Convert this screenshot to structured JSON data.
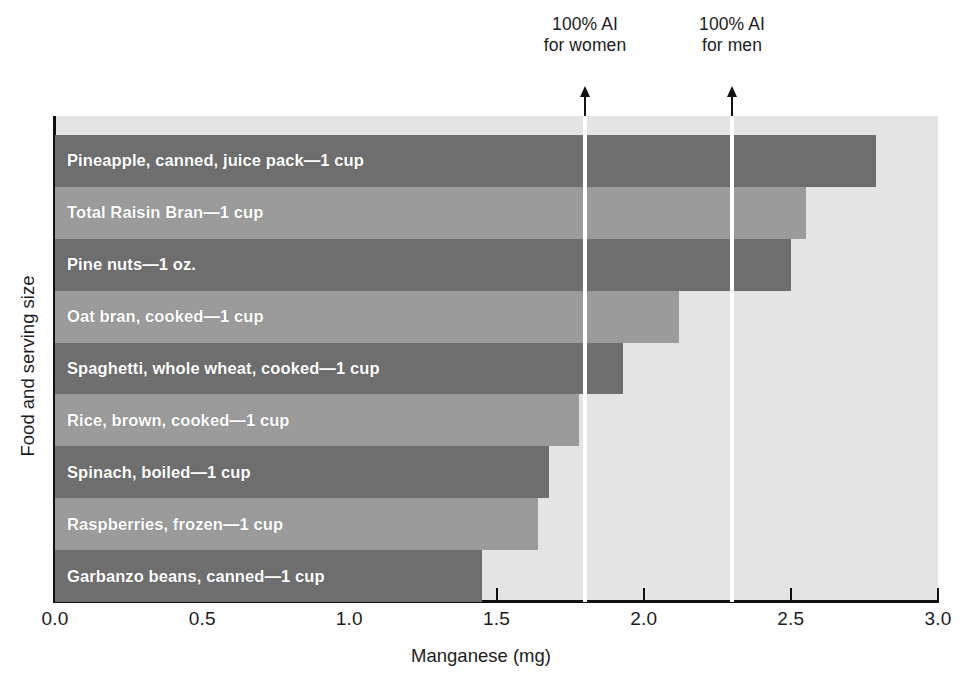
{
  "chart_data": {
    "type": "bar",
    "orientation": "horizontal",
    "title": "",
    "xlabel": "Manganese (mg)",
    "ylabel": "Food and serving size",
    "xlim": [
      0.0,
      3.0
    ],
    "xticks": [
      "0.0",
      "0.5",
      "1.0",
      "1.5",
      "2.0",
      "2.5",
      "3.0"
    ],
    "xtick_values": [
      0.0,
      0.5,
      1.0,
      1.5,
      2.0,
      2.5,
      3.0
    ],
    "grid": false,
    "legend": "none",
    "categories": [
      "Pineapple, canned, juice pack—1 cup",
      "Total Raisin Bran—1 cup",
      "Pine nuts—1 oz.",
      "Oat bran, cooked—1 cup",
      "Spaghetti, whole wheat, cooked—1 cup",
      "Rice, brown, cooked—1 cup",
      "Spinach, boiled—1 cup",
      "Raspberries, frozen—1 cup",
      "Garbanzo beans, canned—1 cup"
    ],
    "values": [
      2.79,
      2.55,
      2.5,
      2.12,
      1.93,
      1.78,
      1.68,
      1.64,
      1.45
    ],
    "bar_shades": [
      "dark",
      "light",
      "dark",
      "light",
      "dark",
      "light",
      "dark",
      "light",
      "dark"
    ],
    "annotations": [
      {
        "label_line1": "100% AI",
        "label_line2": "for women",
        "value": 1.8
      },
      {
        "label_line1": "100% AI",
        "label_line2": "for men",
        "value": 2.3
      }
    ]
  },
  "colors": {
    "bar_dark": "#6e6e6e",
    "bar_light": "#9b9b9b",
    "plot_background": "#e4e4e4",
    "reference_line": "#ffffff",
    "axis": "#111111",
    "bar_label_text": "#ffffff"
  }
}
